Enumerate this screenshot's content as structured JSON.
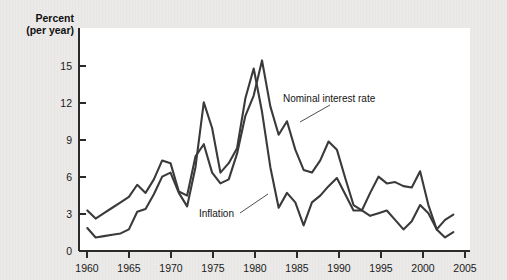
{
  "figure": {
    "background_color": "#ecebe9",
    "plot_background_color": "#ffffff",
    "line_color": "#3a3a3a"
  },
  "labels": {
    "y_axis_title_line1": "Percent",
    "y_axis_title_line2": "(per year)",
    "nominal_annotation": "Nominal interest rate",
    "inflation_annotation": "Inflation"
  },
  "chart_data": {
    "type": "line",
    "title": "",
    "subtitle": "",
    "xlabel": "",
    "ylabel": "Percent (per year)",
    "xlim": [
      1959,
      2006
    ],
    "ylim": [
      0,
      16.5
    ],
    "xticks": [
      1960,
      1965,
      1970,
      1975,
      1980,
      1985,
      1990,
      1995,
      2000,
      2005
    ],
    "xtick_labels": [
      "1960",
      "1965",
      "1970",
      "1975",
      "1980",
      "1985",
      "1990",
      "1995",
      "2000",
      "2005"
    ],
    "yticks": [
      0,
      3,
      6,
      9,
      12,
      15
    ],
    "ytick_labels": [
      "0",
      "3",
      "6",
      "9",
      "12",
      "15"
    ],
    "grid": false,
    "legend_position": "inline-annotations",
    "x": [
      1960,
      1961,
      1962,
      1963,
      1964,
      1965,
      1966,
      1967,
      1968,
      1969,
      1970,
      1971,
      1972,
      1973,
      1974,
      1975,
      1976,
      1977,
      1978,
      1979,
      1980,
      1981,
      1982,
      1983,
      1984,
      1985,
      1986,
      1987,
      1988,
      1989,
      1990,
      1991,
      1992,
      1993,
      1994,
      1995,
      1996,
      1997,
      1998,
      1999,
      2000,
      2001,
      2002,
      2003,
      2004
    ],
    "series": [
      {
        "name": "Nominal interest rate",
        "values": [
          3.0,
          2.4,
          2.8,
          3.2,
          3.6,
          4.0,
          4.9,
          4.3,
          5.3,
          6.7,
          6.5,
          4.4,
          4.1,
          7.0,
          7.9,
          5.8,
          5.0,
          5.3,
          7.2,
          10.0,
          11.5,
          14.1,
          10.7,
          8.6,
          9.6,
          7.5,
          6.0,
          5.8,
          6.7,
          8.1,
          7.5,
          5.4,
          3.4,
          3.0,
          4.3,
          5.5,
          5.0,
          5.1,
          4.8,
          4.7,
          5.9,
          3.4,
          1.6,
          1.0,
          1.4
        ],
        "color": "#3a3a3a"
      },
      {
        "name": "Inflation",
        "values": [
          1.7,
          1.0,
          1.1,
          1.2,
          1.3,
          1.6,
          2.9,
          3.1,
          4.2,
          5.5,
          5.8,
          4.3,
          3.3,
          6.2,
          11.0,
          9.1,
          5.8,
          6.5,
          7.6,
          11.3,
          13.5,
          10.3,
          6.2,
          3.2,
          4.3,
          3.6,
          1.9,
          3.6,
          4.1,
          4.8,
          5.4,
          4.2,
          3.0,
          3.0,
          2.6,
          2.8,
          3.0,
          2.3,
          1.6,
          2.2,
          3.4,
          2.8,
          1.6,
          2.3,
          2.7
        ],
        "color": "#3a3a3a"
      }
    ]
  }
}
